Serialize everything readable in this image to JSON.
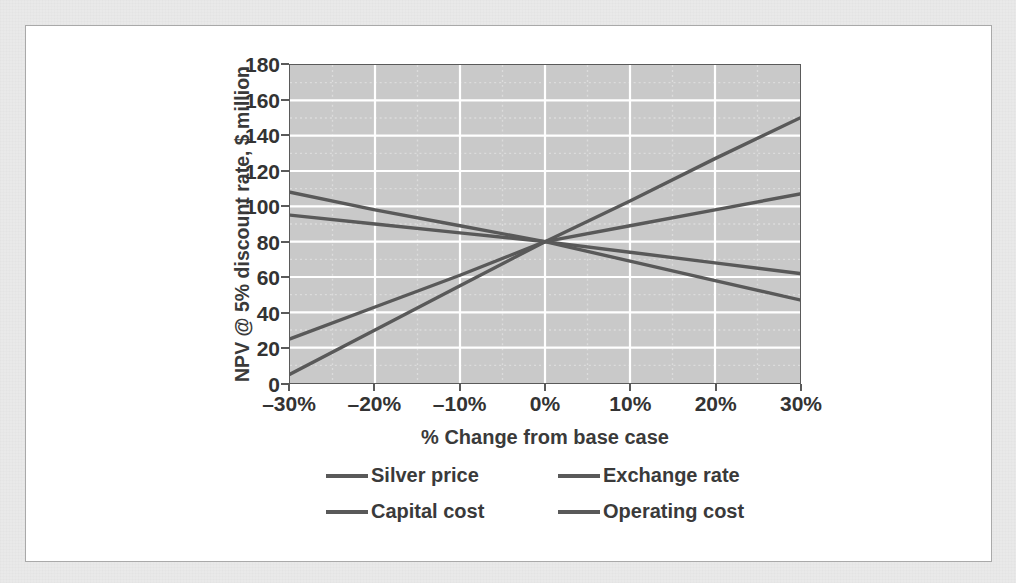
{
  "figure": {
    "background_color": "#e9e9e9",
    "panel_color": "#ffffff",
    "plot_background_color": "#c9c9c9",
    "line_color": "#595959",
    "axis_color": "#5a5a5a",
    "gridline_color": "#ffffff"
  },
  "chart_data": {
    "type": "line",
    "title": "",
    "xlabel": "% Change from base case",
    "ylabel": "NPV @ 5% discount rate, $ million",
    "x": [
      -30,
      -20,
      -10,
      0,
      10,
      20,
      30
    ],
    "xtick_labels": [
      "–30%",
      "–20%",
      "–10%",
      "0%",
      "10%",
      "20%",
      "30%"
    ],
    "ytick_labels": [
      "0",
      "20",
      "40",
      "60",
      "80",
      "100",
      "120",
      "140",
      "160",
      "180"
    ],
    "yticks": [
      0,
      20,
      40,
      60,
      80,
      100,
      120,
      140,
      160,
      180
    ],
    "xlim": [
      -30,
      30
    ],
    "ylim": [
      0,
      180
    ],
    "grid": true,
    "legend_position": "bottom",
    "series": [
      {
        "name": "Silver price",
        "values": [
          5,
          30,
          55,
          80,
          103,
          127,
          150
        ]
      },
      {
        "name": "Exchange rate",
        "values": [
          25,
          43,
          61,
          80,
          89,
          98,
          107
        ]
      },
      {
        "name": "Capital cost",
        "values": [
          95,
          90,
          85,
          80,
          74,
          68,
          62
        ]
      },
      {
        "name": "Operating cost",
        "values": [
          108,
          98,
          89,
          80,
          69,
          58,
          47
        ]
      }
    ]
  },
  "legend": {
    "items": [
      {
        "label": "Silver price"
      },
      {
        "label": "Exchange rate"
      },
      {
        "label": "Capital cost"
      },
      {
        "label": "Operating cost"
      }
    ]
  }
}
